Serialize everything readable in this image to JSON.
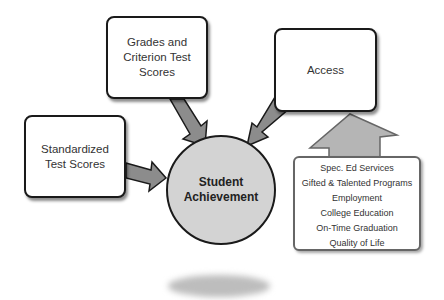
{
  "diagram": {
    "center": {
      "label": "Student\nAchievement"
    },
    "inputs": [
      {
        "id": "grades",
        "label": "Grades and\nCriterion Test\nScores"
      },
      {
        "id": "access",
        "label": "Access"
      },
      {
        "id": "standardized",
        "label": "Standardized\nTest Scores"
      }
    ],
    "access_factors": {
      "items": [
        "Spec. Ed Services",
        "Gifted & Talented Programs",
        "Employment",
        "College Education",
        "On-Time Graduation",
        "Quality of Life"
      ]
    },
    "colors": {
      "arrow_fill": "#8c8c8c",
      "up_arrow_fill": "#b5b5b5",
      "circle_fill": "#d3d3d3",
      "border": "#1a1a1a"
    }
  }
}
